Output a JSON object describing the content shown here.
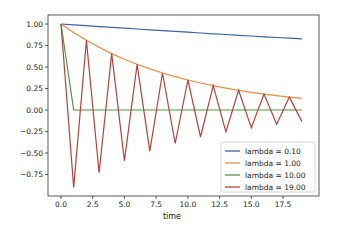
{
  "chart_data": {
    "type": "line",
    "title": "",
    "xlabel": "time",
    "ylabel": "",
    "xlim": [
      -0.95,
      19.95
    ],
    "ylim": [
      -1.0,
      1.1
    ],
    "xticks": [
      "0.0",
      "2.5",
      "5.0",
      "7.5",
      "10.0",
      "12.5",
      "15.0",
      "17.5"
    ],
    "xtick_values": [
      0,
      2.5,
      5,
      7.5,
      10,
      12.5,
      15,
      17.5
    ],
    "yticks": [
      "1.00",
      "0.75",
      "0.50",
      "0.25",
      "0.00",
      "-0.25",
      "-0.50",
      "-0.75"
    ],
    "ytick_values": [
      1,
      0.75,
      0.5,
      0.25,
      0,
      -0.25,
      -0.5,
      -0.75
    ],
    "grid": false,
    "legend_position": "lower right",
    "x": [
      0,
      1,
      2,
      3,
      4,
      5,
      6,
      7,
      8,
      9,
      10,
      11,
      12,
      13,
      14,
      15,
      16,
      17,
      18,
      19
    ],
    "series": [
      {
        "name": "lambda = 0.10",
        "color": "#3b63a8",
        "values": [
          1.0,
          0.99,
          0.9801,
          0.9703,
          0.9606,
          0.951,
          0.9415,
          0.9321,
          0.9227,
          0.9135,
          0.9044,
          0.8953,
          0.8864,
          0.8775,
          0.8687,
          0.8601,
          0.8515,
          0.8429,
          0.8345,
          0.8262
        ]
      },
      {
        "name": "lambda = 1.00",
        "color": "#f08a3e",
        "values": [
          1.0,
          0.9,
          0.81,
          0.729,
          0.6561,
          0.5905,
          0.5314,
          0.4783,
          0.4305,
          0.3874,
          0.3487,
          0.3138,
          0.2824,
          0.2542,
          0.2288,
          0.2059,
          0.1853,
          0.1668,
          0.1501,
          0.1351
        ]
      },
      {
        "name": "lambda = 10.00",
        "color": "#4c9a45",
        "values": [
          1.0,
          0,
          0,
          0,
          0,
          0,
          0,
          0,
          0,
          0,
          0,
          0,
          0,
          0,
          0,
          0,
          0,
          0,
          0,
          0
        ]
      },
      {
        "name": "lambda = 19.00",
        "color": "#b5433b",
        "values": [
          1.0,
          -0.9,
          0.81,
          -0.729,
          0.6561,
          -0.5905,
          0.5314,
          -0.4783,
          0.4305,
          -0.3874,
          0.3487,
          -0.3138,
          0.2824,
          -0.2542,
          0.2288,
          -0.2059,
          0.1853,
          -0.1668,
          0.1501,
          -0.1351
        ]
      }
    ]
  }
}
